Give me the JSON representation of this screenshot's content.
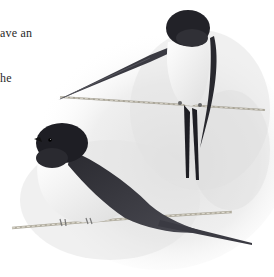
{
  "text_fragments": [
    {
      "text": "ave an",
      "x": 0,
      "y": 26
    },
    {
      "text": "he",
      "x": 0,
      "y": 71
    }
  ],
  "illustration": {
    "subject": "two barn swallows perched on a twisted wire",
    "style": "monochrome watercolor / pencil",
    "colors": {
      "background": "#ffffff",
      "wash": "#e6e6e6",
      "wash_dark": "#cfcfcf",
      "bird_dark": "#1e1e22",
      "bird_mid": "#3a3a40",
      "belly": "#f6f6f6",
      "wire": "#b8b4a8"
    }
  }
}
